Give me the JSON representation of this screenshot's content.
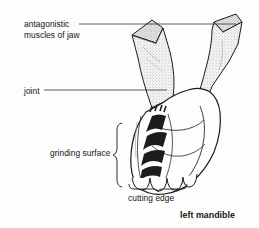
{
  "figure": {
    "title": "left mandible",
    "background_color": "#fdfdfd",
    "ink_color": "#141414",
    "stipple_color": "#8d8d8d",
    "shade_color": "#b5b5b5",
    "ridge_color": "#1d1d1d"
  },
  "labels": {
    "antagonistic": "antagonistic\nmuscles of jaw",
    "antagonistic_line1": "antagonistic",
    "antagonistic_line2": "muscles of jaw",
    "joint": "joint",
    "grinding": "grinding surface",
    "cutting": "cutting edge",
    "mandible": "left mandible"
  },
  "leaders": [
    {
      "name": "antagonistic-leader",
      "from": [
        79,
        24
      ],
      "to": [
        236,
        24
      ]
    },
    {
      "name": "joint-leader",
      "from": [
        44,
        90
      ],
      "to": [
        165,
        90
      ]
    }
  ],
  "braces": [
    {
      "name": "grinding-surface-brace",
      "orientation": "vertical",
      "x": 119,
      "top": 123,
      "bottom": 186
    },
    {
      "name": "cutting-edge-brace",
      "orientation": "horizontal",
      "y": 188,
      "left": 129,
      "right": 186
    }
  ],
  "parts": [
    {
      "name": "left-muscle",
      "description": "stippled tapering muscle, upper left, attaches to mandible apodeme"
    },
    {
      "name": "right-muscle",
      "description": "stippled tapering muscle, upper right, narrows to tendon"
    },
    {
      "name": "joint-lobe",
      "description": "grey shaded articulation lobe at mandible base"
    },
    {
      "name": "mandible-body",
      "description": "outlined jaw body occupying lower right"
    },
    {
      "name": "grinding-ridges",
      "description": "five nested dark chevron ridges forming molar grinding surface"
    },
    {
      "name": "cutting-teeth",
      "description": "four scalloped lobes forming the incisor cutting edge"
    }
  ]
}
